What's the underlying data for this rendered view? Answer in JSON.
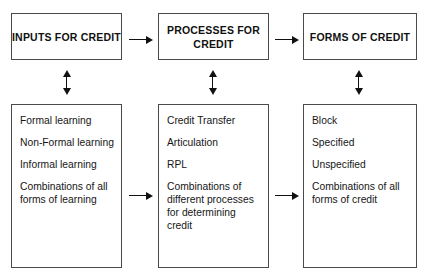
{
  "diagram": {
    "background_color": "#ffffff",
    "border_color": "#4a4a4a",
    "arrow_color": "#111111"
  },
  "columns": [
    {
      "key": "inputs",
      "header": "INPUTS FOR\nCREDIT",
      "items": [
        "Formal learning",
        "Non-Formal learning",
        "Informal learning",
        "Combinations of all\nforms of learning"
      ]
    },
    {
      "key": "processes",
      "header": "PROCESSES\nFOR CREDIT",
      "items": [
        "Credit Transfer",
        "Articulation",
        "RPL",
        "Combinations of\ndifferent processes\nfor determining\ncredit"
      ]
    },
    {
      "key": "forms",
      "header": "FORMS OF\nCREDIT",
      "items": [
        "Block",
        "Specified",
        "Unspecified",
        "Combinations of all\nforms of credit"
      ]
    }
  ],
  "connectors": {
    "header_inputs_to_processes": "arrow-right",
    "header_processes_to_forms": "arrow-right",
    "inputs_header_to_list": "arrow-up-down",
    "processes_header_to_list": "arrow-up-down",
    "forms_header_to_list": "arrow-up-down",
    "list_inputs_to_processes": "arrow-right",
    "list_processes_to_forms": "arrow-right"
  }
}
